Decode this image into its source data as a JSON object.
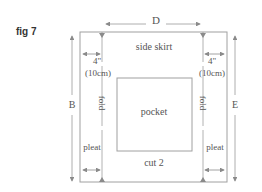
{
  "figure": {
    "label": "fig 7",
    "title": "side skirt",
    "pocket_label": "pocket",
    "cut_label": "cut 2",
    "dimensions": {
      "width_label": "D",
      "left_height_label": "B",
      "right_height_label": "E",
      "left_allowance_in": "4\"",
      "left_allowance_cm": "(10cm)",
      "right_allowance_in": "4\"",
      "right_allowance_cm": "(10cm)"
    },
    "fold_labels": [
      "fold",
      "fold"
    ],
    "pleat_labels": [
      "pleat",
      "pleat"
    ]
  },
  "colors": {
    "line": "#9a9a9a",
    "text": "#555555",
    "arrow": "#888888"
  }
}
